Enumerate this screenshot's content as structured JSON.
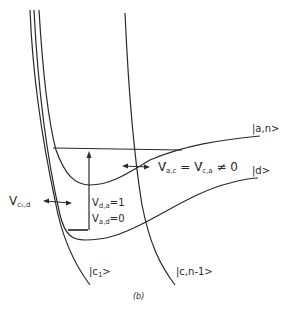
{
  "figure": {
    "caption": "(b)",
    "states": {
      "a_n": "|a,n>",
      "d": "|d>",
      "c1": "|c",
      "c1_sub": "1",
      "c1_end": ">",
      "c_n1": "|c,n-1>"
    },
    "couplings": {
      "vcd_main": "V",
      "vcd_sub": "c₁,d",
      "vac_main": "V",
      "vac_sup": "r",
      "vac_sub": "a,c",
      "vac_eq": " = ",
      "vca_main": "V",
      "vca_sup": "r",
      "vca_sub": "c,a",
      "vca_neq": " ≠ 0",
      "vda_main": "V",
      "vda_sub": "d,a",
      "vda_val": "=1",
      "vad_main": "V",
      "vad_sub": "a,d",
      "vad_val": "=0"
    },
    "colors": {
      "line": "#2a2a2a",
      "background": "#ffffff"
    }
  }
}
